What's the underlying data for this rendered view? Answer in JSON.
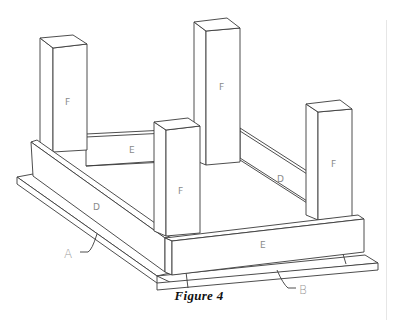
{
  "figure": {
    "caption": "Figure 4",
    "parts": {
      "post_back_left": "F",
      "post_back_right": "F",
      "post_front_left": "F",
      "post_front_right": "F",
      "rail_back": "E",
      "rail_front": "E",
      "rail_left": "D",
      "rail_right": "D"
    },
    "callouts": {
      "left_base": "A",
      "front_base": "B"
    }
  }
}
